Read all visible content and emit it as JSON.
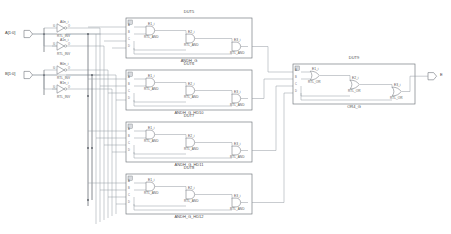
{
  "diagram": {
    "kind": "rtl-schematic"
  },
  "ports": {
    "inputs": [
      {
        "name": "A[1:0]",
        "x": 14,
        "y": 34
      },
      {
        "name": "B[1:0]",
        "x": 14,
        "y": 75
      }
    ],
    "outputs": [
      {
        "name": "E",
        "x": 434,
        "y": 76
      }
    ]
  },
  "inverters": [
    {
      "inst": "A0n_i",
      "prim": "RTL_INV",
      "x": 66,
      "y": 28,
      "in": "I0",
      "out": "O"
    },
    {
      "inst": "A1n_i",
      "prim": "RTL_INV",
      "x": 66,
      "y": 46,
      "in": "I0",
      "out": "O"
    },
    {
      "inst": "B0n_i",
      "prim": "RTL_INV",
      "x": 66,
      "y": 70,
      "in": "I0",
      "out": "O"
    },
    {
      "inst": "B1n_i",
      "prim": "RTL_INV",
      "x": 66,
      "y": 89,
      "in": "I0",
      "out": "O"
    }
  ],
  "and_blocks": [
    {
      "block": "DUT5",
      "module": "ANDH_G",
      "x": 126,
      "y": 18,
      "w": 126,
      "h": 40,
      "pins": [
        "A",
        "B",
        "C",
        "D"
      ],
      "gates": [
        {
          "inst": "E1_i",
          "prim": "RTL_AND"
        },
        {
          "inst": "E2_i",
          "prim": "RTL_AND"
        },
        {
          "inst": "E3_i",
          "prim": "RTL_AND"
        }
      ]
    },
    {
      "block": "DUT6",
      "module": "ANDH_G_HD10",
      "x": 126,
      "y": 70,
      "w": 126,
      "h": 40,
      "pins": [
        "A",
        "B",
        "C",
        "D"
      ],
      "gates": [
        {
          "inst": "E1_i",
          "prim": "RTL_AND"
        },
        {
          "inst": "E2_i",
          "prim": "RTL_AND"
        },
        {
          "inst": "E3_i",
          "prim": "RTL_AND"
        }
      ]
    },
    {
      "block": "DUT7",
      "module": "ANDH_G_HD11",
      "x": 126,
      "y": 122,
      "w": 126,
      "h": 40,
      "pins": [
        "A",
        "B",
        "C",
        "D"
      ],
      "gates": [
        {
          "inst": "E1_i",
          "prim": "RTL_AND"
        },
        {
          "inst": "E2_i",
          "prim": "RTL_AND"
        },
        {
          "inst": "E3_i",
          "prim": "RTL_AND"
        }
      ]
    },
    {
      "block": "DUT8",
      "module": "ANDH_G_HD12",
      "x": 126,
      "y": 174,
      "w": 126,
      "h": 40,
      "pins": [
        "A",
        "B",
        "C",
        "D"
      ],
      "gates": [
        {
          "inst": "E1_i",
          "prim": "RTL_AND"
        },
        {
          "inst": "E2_i",
          "prim": "RTL_AND"
        },
        {
          "inst": "E3_i",
          "prim": "RTL_AND"
        }
      ]
    }
  ],
  "or_block": {
    "block": "DUT9",
    "module": "OR4_G",
    "x": 293,
    "y": 64,
    "w": 122,
    "h": 40,
    "pins": [
      "A",
      "B",
      "C",
      "D"
    ],
    "gates": [
      {
        "inst": "E1_i",
        "prim": "RTL_OR"
      },
      {
        "inst": "E2_i",
        "prim": "RTL_OR"
      },
      {
        "inst": "E3_i",
        "prim": "RTL_OR"
      }
    ]
  },
  "colors": {
    "wire": "#8a8f96",
    "bus": "#55595e",
    "outline": "#6f747a",
    "text": "#4a4a4a",
    "fill": "#ffffff"
  }
}
